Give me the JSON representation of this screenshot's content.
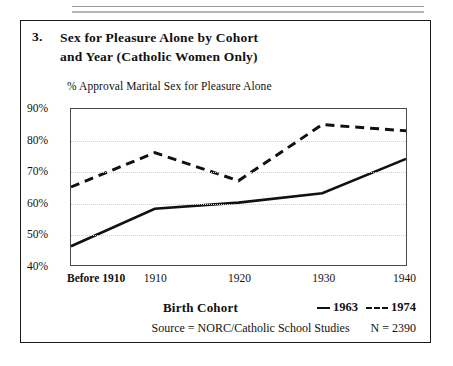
{
  "figure": {
    "number": "3.",
    "title_line1": "Sex for Pleasure Alone by Cohort",
    "title_line2": "and Year (Catholic Women Only)",
    "axis_caption": "% Approval Marital Sex for Pleasure Alone",
    "xaxis_title": "Birth Cohort",
    "source": "Source = NORC/Catholic School Studies",
    "n_value": "N = 2390"
  },
  "legend": {
    "series1_label": "1963",
    "series2_label": "1974",
    "series1_style": "solid",
    "series2_style": "dashed"
  },
  "colors": {
    "line": "#111111",
    "frame": "#4a4a4a",
    "grid": "#cfcfcf",
    "box_border": "#1a1a1a",
    "background": "#ffffff"
  },
  "chart_data": {
    "type": "line",
    "title": "Sex for Pleasure Alone by Cohort and Year (Catholic Women Only)",
    "xlabel": "Birth Cohort",
    "ylabel": "% Approval Marital Sex for Pleasure Alone",
    "categories": [
      "Before 1910",
      "1910",
      "1920",
      "1930",
      "1940"
    ],
    "ylim": [
      40,
      90
    ],
    "yticks": [
      "40%",
      "50%",
      "60%",
      "70%",
      "80%",
      "90%"
    ],
    "ytick_values": [
      40,
      50,
      60,
      70,
      80,
      90
    ],
    "grid": true,
    "legend_position": "below-right",
    "series": [
      {
        "name": "1963",
        "style": "solid",
        "values": [
          46,
          58,
          60,
          63,
          74
        ]
      },
      {
        "name": "1974",
        "style": "dashed",
        "values": [
          65,
          76,
          67,
          85,
          83
        ]
      }
    ],
    "annotations": [
      "Source = NORC/Catholic School Studies",
      "N = 2390"
    ]
  }
}
